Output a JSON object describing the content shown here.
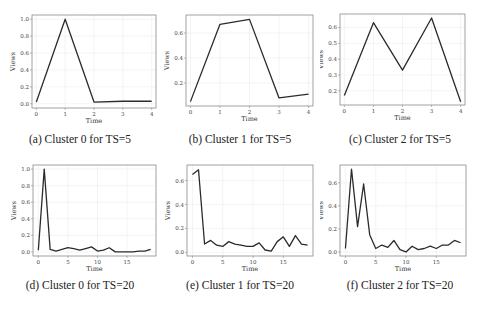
{
  "chart_data": [
    {
      "id": "a",
      "type": "line",
      "caption": "(a) Cluster 0 for TS=5",
      "xlabel": "Time",
      "ylabel": "Views",
      "x": [
        0,
        1,
        2,
        3,
        4
      ],
      "values": [
        0.02,
        1.0,
        0.02,
        0.03,
        0.03
      ],
      "xlim": [
        -0.15,
        4.15
      ],
      "ylim": [
        -0.05,
        1.05
      ],
      "xticks": [
        0,
        1,
        2,
        3,
        4
      ],
      "yticks": [
        0.0,
        0.2,
        0.4,
        0.6,
        0.8,
        1.0
      ],
      "ytick_labels": [
        "0.0",
        "0.2",
        "0.4",
        "0.6",
        "0.8",
        "1.0"
      ],
      "grid": true
    },
    {
      "id": "b",
      "type": "line",
      "caption": "(b) Cluster 1 for TS=5",
      "xlabel": "Time",
      "ylabel": "Views",
      "x": [
        0,
        1,
        2,
        3,
        4
      ],
      "values": [
        0.05,
        0.67,
        0.71,
        0.08,
        0.11
      ],
      "xlim": [
        -0.15,
        4.15
      ],
      "ylim": [
        0.015,
        0.745
      ],
      "xticks": [
        0,
        1,
        2,
        3,
        4
      ],
      "yticks": [
        0.2,
        0.4,
        0.6
      ],
      "ytick_labels": [
        "0.2",
        "0.4",
        "0.6"
      ],
      "grid": true
    },
    {
      "id": "c",
      "type": "line",
      "caption": "(c) Cluster 2 for TS=5",
      "xlabel": "Time",
      "ylabel": "Views",
      "x": [
        0,
        1,
        2,
        3,
        4
      ],
      "values": [
        0.17,
        0.63,
        0.33,
        0.66,
        0.13
      ],
      "xlim": [
        -0.15,
        4.15
      ],
      "ylim": [
        0.11,
        0.685
      ],
      "xticks": [
        0,
        1,
        2,
        3,
        4
      ],
      "yticks": [
        0.2,
        0.3,
        0.4,
        0.5,
        0.6
      ],
      "ytick_labels": [
        "0.2",
        "0.3",
        "0.4",
        "0.5",
        "0.6"
      ],
      "grid": true
    },
    {
      "id": "d",
      "type": "line",
      "caption": "(d) Cluster 0 for TS=20",
      "xlabel": "Time",
      "ylabel": "Views",
      "x": [
        0,
        1,
        2,
        3,
        4,
        5,
        6,
        7,
        8,
        9,
        10,
        11,
        12,
        13,
        14,
        15,
        16,
        17,
        18,
        19
      ],
      "values": [
        0.02,
        1.0,
        0.03,
        0.01,
        0.03,
        0.05,
        0.04,
        0.02,
        0.04,
        0.06,
        0.01,
        0.02,
        0.05,
        0.0,
        0.0,
        0.0,
        0.0,
        0.01,
        0.01,
        0.03
      ],
      "xlim": [
        -0.9,
        19.9
      ],
      "ylim": [
        -0.05,
        1.05
      ],
      "xticks": [
        0,
        5,
        10,
        15
      ],
      "yticks": [
        0.0,
        0.2,
        0.4,
        0.6,
        0.8,
        1.0
      ],
      "ytick_labels": [
        "0.0",
        "0.2",
        "0.4",
        "0.6",
        "0.8",
        "1.0"
      ],
      "grid": true
    },
    {
      "id": "e",
      "type": "line",
      "caption": "(e) Cluster 1 for TS=20",
      "xlabel": "Time",
      "ylabel": "Views",
      "x": [
        0,
        1,
        2,
        3,
        4,
        5,
        6,
        7,
        8,
        9,
        10,
        11,
        12,
        13,
        14,
        15,
        16,
        17,
        18,
        19
      ],
      "values": [
        0.65,
        0.69,
        0.07,
        0.1,
        0.06,
        0.05,
        0.09,
        0.07,
        0.06,
        0.05,
        0.05,
        0.08,
        0.02,
        0.01,
        0.09,
        0.13,
        0.05,
        0.14,
        0.07,
        0.06
      ],
      "xlim": [
        -0.9,
        19.9
      ],
      "ylim": [
        -0.03,
        0.73
      ],
      "xticks": [
        0,
        5,
        10,
        15
      ],
      "yticks": [
        0.0,
        0.2,
        0.4,
        0.6
      ],
      "ytick_labels": [
        "0.0",
        "0.2",
        "0.4",
        "0.6"
      ],
      "grid": true
    },
    {
      "id": "f",
      "type": "line",
      "caption": "(f) Cluster 2 for TS=20",
      "xlabel": "Time",
      "ylabel": "Views",
      "x": [
        0,
        1,
        2,
        3,
        4,
        5,
        6,
        7,
        8,
        9,
        10,
        11,
        12,
        13,
        14,
        15,
        16,
        17,
        18,
        19
      ],
      "values": [
        0.03,
        0.72,
        0.22,
        0.59,
        0.15,
        0.03,
        0.06,
        0.04,
        0.1,
        0.02,
        0.0,
        0.05,
        0.02,
        0.03,
        0.05,
        0.03,
        0.06,
        0.06,
        0.1,
        0.08
      ],
      "xlim": [
        -0.9,
        19.9
      ],
      "ylim": [
        -0.035,
        0.755
      ],
      "xticks": [
        0,
        5,
        10,
        15
      ],
      "yticks": [
        0.0,
        0.2,
        0.4,
        0.6
      ],
      "ytick_labels": [
        "0.0",
        "0.2",
        "0.4",
        "0.6"
      ],
      "grid": true
    }
  ],
  "style": {
    "line_color": "#2b2b2b",
    "frame_color": "#8a8a8a",
    "grid_color": "#ececec"
  }
}
